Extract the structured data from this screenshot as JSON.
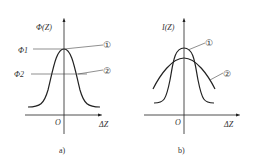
{
  "panels": [
    {
      "id": "a",
      "caption": "a)",
      "y_label": "Φ(Z)",
      "x_label": "ΔZ",
      "origin_label": "O",
      "level_labels": [
        "Φ1",
        "Φ2"
      ],
      "callouts": [
        "①",
        "②"
      ]
    },
    {
      "id": "b",
      "caption": "b)",
      "y_label": "I(Z)",
      "x_label": "ΔZ",
      "origin_label": "O",
      "callouts": [
        "①",
        "②"
      ]
    }
  ],
  "colors": {
    "line": "#222222",
    "text": "#333333"
  }
}
